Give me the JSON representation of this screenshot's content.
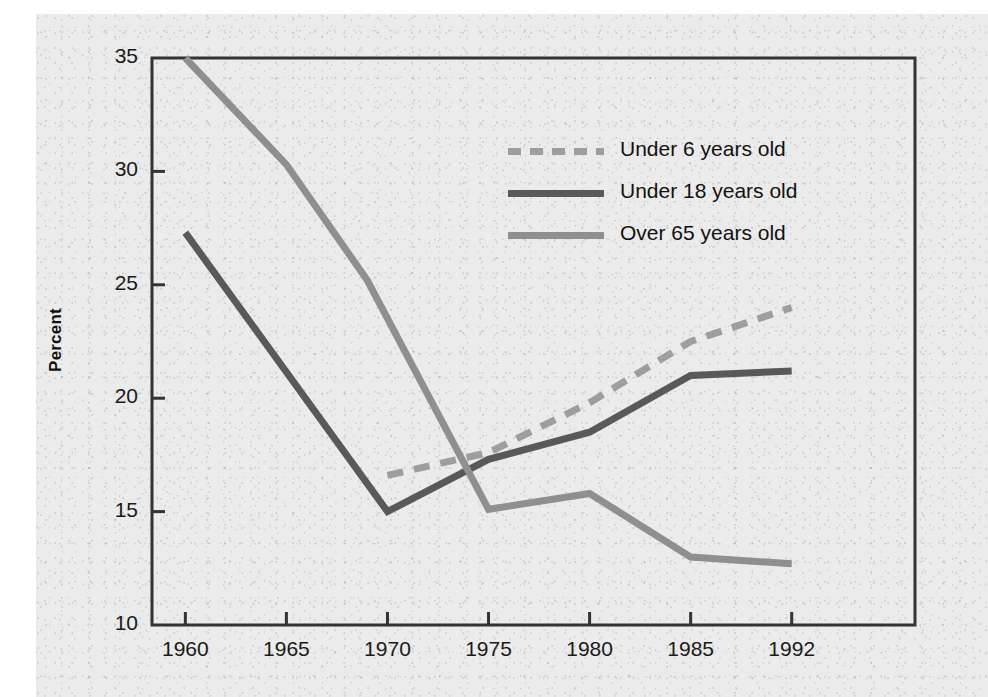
{
  "figure": {
    "background_color": "#ebebeb",
    "page_color": "#ffffff",
    "axis_color": "#333333"
  },
  "axes": {
    "y_title": "Percent",
    "y_ticks": [
      "35",
      "30",
      "25",
      "20",
      "15",
      "10"
    ],
    "x_ticks": [
      "1960",
      "1965",
      "1970",
      "1975",
      "1980",
      "1985",
      "1992"
    ]
  },
  "legend": {
    "items": [
      {
        "label": "Under 6 years old",
        "color": "#9e9e9e",
        "style": "dashed"
      },
      {
        "label": "Under 18 years old",
        "color": "#595959",
        "style": "solid"
      },
      {
        "label": "Over 65 years old",
        "color": "#8f8f8f",
        "style": "solid"
      }
    ]
  },
  "chart_data": {
    "type": "line",
    "title": "",
    "xlabel": "",
    "ylabel": "Percent",
    "xlim_categories": [
      "1960",
      "1965",
      "1970",
      "1975",
      "1980",
      "1985",
      "1992"
    ],
    "ylim": [
      10,
      35
    ],
    "y_ticks": [
      10,
      15,
      20,
      25,
      30,
      35
    ],
    "grid": false,
    "legend_position": "upper-center-right",
    "series": [
      {
        "name": "Under 6 years old",
        "color": "#9e9e9e",
        "style": "dashed",
        "x": [
          "1970",
          "1975",
          "1980",
          "1985",
          "1992"
        ],
        "values": [
          16.6,
          17.6,
          19.8,
          22.5,
          24.0
        ]
      },
      {
        "name": "Under 18 years old",
        "color": "#595959",
        "style": "solid",
        "x": [
          "1960",
          "1970",
          "1975",
          "1980",
          "1985",
          "1992"
        ],
        "values": [
          27.3,
          15.0,
          17.3,
          18.5,
          21.0,
          21.2
        ]
      },
      {
        "name": "Over 65 years old",
        "color": "#8f8f8f",
        "style": "solid",
        "x": [
          "1960",
          "1965",
          "1969",
          "1975",
          "1980",
          "1985",
          "1992"
        ],
        "values": [
          35.0,
          30.3,
          25.2,
          15.1,
          15.8,
          13.0,
          12.7
        ]
      }
    ]
  }
}
